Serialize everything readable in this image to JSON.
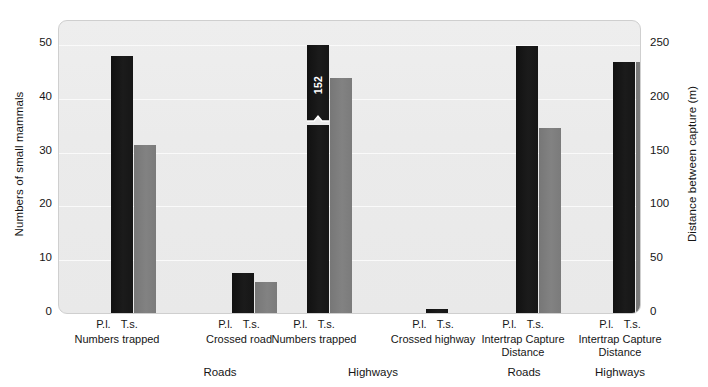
{
  "chart_data": {
    "type": "bar",
    "title": "",
    "subtitle": "",
    "ylabel": "Numbers of small mammals",
    "ylabel_right": "Distance between capture (m)",
    "xlabel": "",
    "ylim": [
      0,
      50
    ],
    "ylim_right": [
      0,
      250
    ],
    "yticks": [
      "0",
      "10",
      "20",
      "30",
      "40",
      "50"
    ],
    "yticks_right": [
      "0",
      "50",
      "100",
      "150",
      "200",
      "250"
    ],
    "grid": true,
    "legend_position": "none",
    "series": [
      {
        "name": "P.l.",
        "color": "#161616",
        "values": [
          48,
          7.7,
          50,
          1.0,
          49.8,
          46.8
        ]
      },
      {
        "name": "T.s.",
        "color": "#7d7d7d",
        "values": [
          31.5,
          6.0,
          43.8,
          0.2,
          34.6,
          46.8
        ]
      }
    ],
    "categories": [
      "Numbers trapped",
      "Crossed road",
      "Numbers trapped",
      "Crossed highway",
      "Intertrap Capture\nDistance",
      "Intertrap Capture\nDistance"
    ],
    "group_axis": [
      "Roads",
      "Highways",
      "Intertrap Capture Distance Roads",
      "Intertrap Capture Distance Highways"
    ],
    "supergroups": [
      {
        "label": "Roads"
      },
      {
        "label": "Highways"
      },
      {
        "label": "Roads"
      },
      {
        "label": "Highways"
      }
    ],
    "annotations": [
      {
        "text": "152",
        "series": "P.l.",
        "group_index": 2,
        "note": "bar axis-break; true value 152 exceeds left axis maximum"
      }
    ],
    "axis_assignment": {
      "left_axis_groups": [
        0,
        1,
        2,
        3
      ],
      "right_axis_groups": [
        4,
        5
      ]
    },
    "right_axis_values_m": {
      "Intertrap Capture Distance Roads": {
        "P.l.": 249,
        "T.s.": 173
      },
      "Intertrap Capture Distance Highways": {
        "P.l.": 234,
        "T.s.": 234
      }
    }
  },
  "groups": [
    {
      "cat": "Numbers trapped",
      "s1": "P.l.",
      "s2": "T.s."
    },
    {
      "cat": "Crossed road",
      "s1": "P.l.",
      "s2": "T.s."
    },
    {
      "cat": "Numbers trapped",
      "s1": "P.l.",
      "s2": "T.s."
    },
    {
      "cat": "Crossed highway",
      "s1": "P.l.",
      "s2": "T.s."
    },
    {
      "cat": "Intertrap Capture\nDistance",
      "s1": "P.l.",
      "s2": "T.s."
    },
    {
      "cat": "Intertrap Capture\nDistance",
      "s1": "P.l.",
      "s2": "T.s."
    }
  ],
  "supergroups": [
    "Roads",
    "Highways",
    "Roads",
    "Highways"
  ],
  "colors": {
    "series_dark": "#161616",
    "series_light": "#7d7d7d",
    "plot_background": "#ebebeb",
    "gridline": "#fafafa",
    "frame": "#cfcfcf",
    "text": "#161616"
  }
}
